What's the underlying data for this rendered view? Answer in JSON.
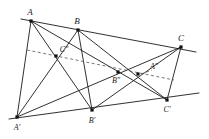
{
  "figure": {
    "width": 209,
    "height": 139,
    "background_color": "#ffffff",
    "line_color": "#1b1b1b",
    "dashed_line_color": "#555555",
    "point_color": "#111111"
  },
  "labels": {
    "A": "A",
    "B": "B",
    "C": "C",
    "A_prime": "A'",
    "B_prime": "B'",
    "C_prime": "C'",
    "A_double_prime": "A\"",
    "B_double_prime": "B\"",
    "C_double_prime": "C\""
  },
  "chart_data": {
    "type": "scatter",
    "xlabel": "",
    "ylabel": "",
    "xlim": [
      0,
      209
    ],
    "ylim": [
      139,
      0
    ],
    "grid": false,
    "legend": "none",
    "points": [
      {
        "name": "A",
        "label": "A",
        "x": 31,
        "y": 21,
        "label_x": 30,
        "label_y": 12
      },
      {
        "name": "B",
        "label": "B",
        "x": 78,
        "y": 30,
        "label_x": 77,
        "label_y": 21
      },
      {
        "name": "C",
        "label": "C",
        "x": 181,
        "y": 47,
        "label_x": 181,
        "label_y": 38
      },
      {
        "name": "A'",
        "label": "A'",
        "x": 17,
        "y": 117,
        "label_x": 17,
        "label_y": 128
      },
      {
        "name": "B'",
        "label": "B'",
        "x": 92,
        "y": 110,
        "label_x": 92,
        "label_y": 121
      },
      {
        "name": "C'",
        "label": "C'",
        "x": 167,
        "y": 100,
        "label_x": 167,
        "label_y": 110
      },
      {
        "name": "A\"",
        "label": "A\"",
        "x": 138,
        "y": 74,
        "label_x": 154,
        "label_y": 67
      },
      {
        "name": "B\"",
        "label": "B\"",
        "x": 118,
        "y": 72,
        "label_x": 116,
        "label_y": 81
      },
      {
        "name": "C\"",
        "label": "C\"",
        "x": 56,
        "y": 56,
        "label_x": 64,
        "label_y": 50
      }
    ],
    "solid_segments": [
      {
        "name": "line-ABC",
        "x1": 21,
        "y1": 19,
        "x2": 196,
        "y2": 52
      },
      {
        "name": "line-A'B'C'",
        "x1": 9,
        "y1": 119,
        "x2": 199,
        "y2": 93
      },
      {
        "name": "A-to-A'",
        "x1": 31,
        "y1": 21,
        "x2": 17,
        "y2": 117
      },
      {
        "name": "A-to-B'",
        "x1": 31,
        "y1": 21,
        "x2": 92,
        "y2": 110
      },
      {
        "name": "A-to-C'",
        "x1": 31,
        "y1": 21,
        "x2": 167,
        "y2": 100
      },
      {
        "name": "B-to-A'",
        "x1": 78,
        "y1": 30,
        "x2": 17,
        "y2": 117
      },
      {
        "name": "B-to-B'",
        "x1": 78,
        "y1": 30,
        "x2": 92,
        "y2": 110
      },
      {
        "name": "B-to-C'",
        "x1": 78,
        "y1": 30,
        "x2": 167,
        "y2": 100
      },
      {
        "name": "C-to-A'",
        "x1": 181,
        "y1": 47,
        "x2": 17,
        "y2": 117
      },
      {
        "name": "C-to-B'",
        "x1": 181,
        "y1": 47,
        "x2": 92,
        "y2": 110
      },
      {
        "name": "C-to-C'",
        "x1": 181,
        "y1": 47,
        "x2": 167,
        "y2": 100
      }
    ],
    "dashed_segments": [
      {
        "name": "pappus-line",
        "x1": 27,
        "y1": 50,
        "x2": 174,
        "y2": 80
      },
      {
        "name": "A''-leader",
        "x1": 141,
        "y1": 74,
        "x2": 152,
        "y2": 70
      }
    ]
  }
}
